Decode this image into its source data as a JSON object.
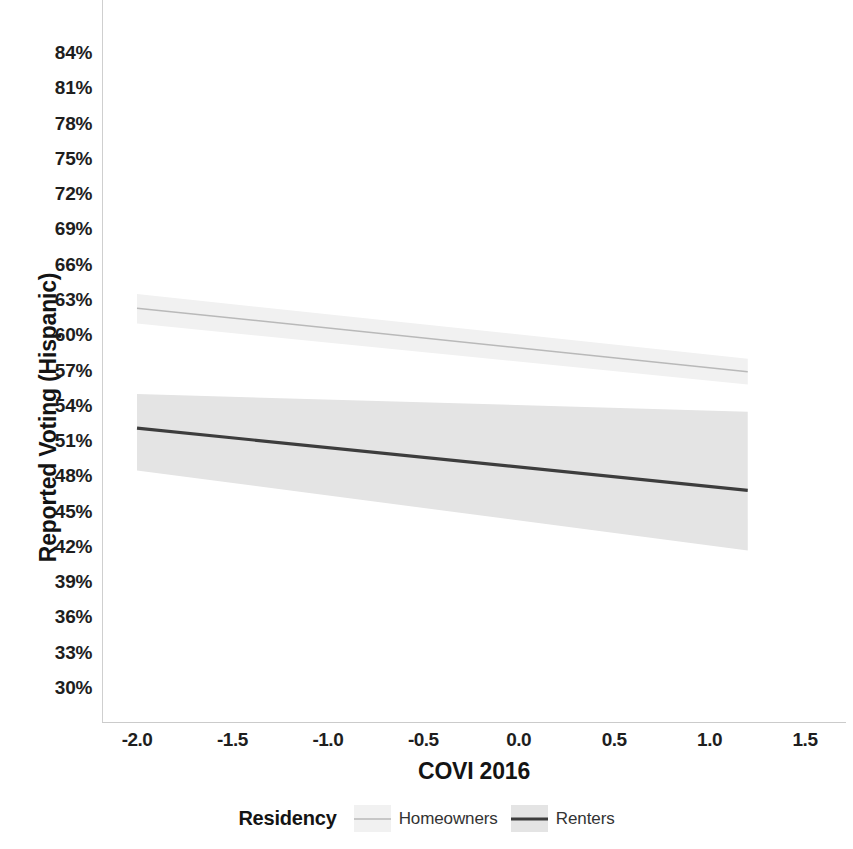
{
  "chart_data": {
    "type": "line",
    "title": "",
    "xlabel": "COVI 2016",
    "ylabel": "Reported Voting (Hispanic)",
    "xlim": [
      -2.25,
      1.75
    ],
    "ylim": [
      29.0,
      85.5
    ],
    "grid": false,
    "x_ticks": [
      "-2.0",
      "-1.5",
      "-1.0",
      "-0.5",
      "0.0",
      "0.5",
      "1.0",
      "1.5"
    ],
    "x_tick_values": [
      -2.0,
      -1.5,
      -1.0,
      -0.5,
      0.0,
      0.5,
      1.0,
      1.5
    ],
    "y_ticks": [
      "84%",
      "81%",
      "78%",
      "75%",
      "72%",
      "69%",
      "66%",
      "63%",
      "60%",
      "57%",
      "54%",
      "51%",
      "48%",
      "45%",
      "42%",
      "39%",
      "36%",
      "33%",
      "30%"
    ],
    "y_tick_values": [
      84,
      81,
      78,
      75,
      72,
      69,
      66,
      63,
      60,
      57,
      54,
      51,
      48,
      45,
      42,
      39,
      36,
      33,
      30
    ],
    "legend_title": "Residency",
    "legend_position": "bottom",
    "x_range_data": [
      -2.0,
      1.2
    ],
    "series": [
      {
        "name": "Homeowners",
        "color": "#b9b9b9",
        "band_color": "#f1f1f1",
        "line_width": 1.5,
        "x": [
          -2.0,
          1.2
        ],
        "values": [
          62.3,
          56.9
        ],
        "ci_upper": [
          63.5,
          58.0
        ],
        "ci_lower": [
          61.0,
          55.8
        ]
      },
      {
        "name": "Renters",
        "color": "#3d3d3d",
        "band_color": "#e4e4e4",
        "line_width": 3.2,
        "x": [
          -2.0,
          1.2
        ],
        "values": [
          52.1,
          46.8
        ],
        "ci_upper": [
          55.0,
          53.5
        ],
        "ci_lower": [
          48.5,
          41.7
        ]
      }
    ]
  },
  "axes": {
    "y_title": "Reported Voting (Hispanic)",
    "x_title": "COVI 2016"
  },
  "legend": {
    "title": "Residency",
    "entries": [
      {
        "label": "Homeowners"
      },
      {
        "label": "Renters"
      }
    ]
  }
}
